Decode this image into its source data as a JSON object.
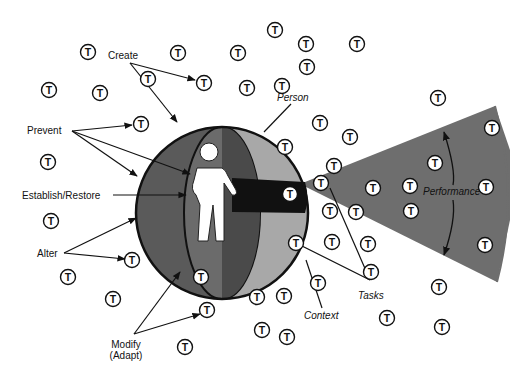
{
  "diagram": {
    "type": "conceptual-diagram",
    "central_element": {
      "label": "Person",
      "container": "sphere"
    },
    "labels": {
      "create": "Create",
      "prevent": "Prevent",
      "establish_restore": "Establish/Restore",
      "alter": "Alter",
      "modify_line1": "Modify",
      "modify_line2": "(Adapt)",
      "person": "Person",
      "context": "Context",
      "tasks": "Tasks",
      "performance": "Performance"
    },
    "task_symbol": "T",
    "task_positions": [
      [
        88,
        52
      ],
      [
        178,
        53
      ],
      [
        275,
        30
      ],
      [
        148,
        79
      ],
      [
        204,
        83
      ],
      [
        238,
        53
      ],
      [
        306,
        44
      ],
      [
        357,
        44
      ],
      [
        49,
        90
      ],
      [
        100,
        93
      ],
      [
        307,
        67
      ],
      [
        247,
        88
      ],
      [
        282,
        86
      ],
      [
        438,
        98
      ],
      [
        141,
        124
      ],
      [
        320,
        123
      ],
      [
        48,
        162
      ],
      [
        350,
        137
      ],
      [
        285,
        147
      ],
      [
        492,
        128
      ],
      [
        321,
        183
      ],
      [
        334,
        166
      ],
      [
        435,
        163
      ],
      [
        373,
        188
      ],
      [
        410,
        186
      ],
      [
        486,
        187
      ],
      [
        290,
        194
      ],
      [
        356,
        212
      ],
      [
        411,
        211
      ],
      [
        485,
        245
      ],
      [
        51,
        221
      ],
      [
        132,
        260
      ],
      [
        330,
        211
      ],
      [
        296,
        243
      ],
      [
        332,
        242
      ],
      [
        368,
        244
      ],
      [
        371,
        272
      ],
      [
        68,
        277
      ],
      [
        113,
        299
      ],
      [
        201,
        277
      ],
      [
        318,
        283
      ],
      [
        284,
        296
      ],
      [
        439,
        287
      ],
      [
        207,
        310
      ],
      [
        257,
        297
      ],
      [
        262,
        330
      ],
      [
        387,
        318
      ],
      [
        442,
        327
      ],
      [
        185,
        347
      ],
      [
        287,
        337
      ],
      [
        348,
        378
      ]
    ],
    "colors": {
      "background": "#ffffff",
      "sphere_dark": "#5a5a5a",
      "sphere_mid": "#7a7a7a",
      "sphere_light": "#a8a8a8",
      "band": "#111111",
      "cone": "#6e6e6e",
      "ink": "#111111"
    }
  }
}
